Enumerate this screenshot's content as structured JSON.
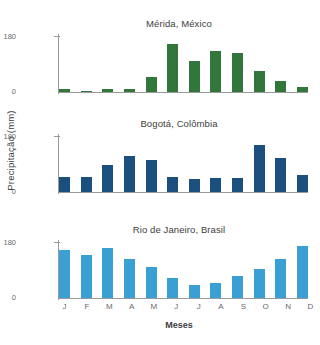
{
  "chart_data": [
    {
      "type": "bar",
      "title": "Mérida, México",
      "xlabel": "Meses",
      "ylabel": "Precipitação (mm)",
      "categories": [
        "J",
        "F",
        "M",
        "A",
        "M",
        "J",
        "J",
        "A",
        "S",
        "O",
        "N",
        "D"
      ],
      "values": [
        10,
        5,
        11,
        9,
        55,
        170,
        110,
        145,
        140,
        75,
        40,
        18
      ],
      "ylim": [
        0,
        200
      ],
      "yticks": [
        0,
        180
      ],
      "ytick_labels": [
        "0",
        "180"
      ],
      "color": "#31763a",
      "grid": false,
      "legend": "none"
    },
    {
      "type": "bar",
      "title": "Bogotá, Colômbia",
      "xlabel": "Meses",
      "ylabel": "Precipitação (mm)",
      "categories": [
        "J",
        "F",
        "M",
        "A",
        "M",
        "J",
        "J",
        "A",
        "S",
        "O",
        "N",
        "D"
      ],
      "values": [
        52,
        53,
        95,
        128,
        115,
        55,
        45,
        50,
        50,
        168,
        120,
        62
      ],
      "ylim": [
        0,
        200
      ],
      "yticks": [
        0,
        180
      ],
      "ytick_labels": [
        "0",
        "180"
      ],
      "color": "#1b4f7e",
      "grid": false,
      "legend": "none"
    },
    {
      "type": "bar",
      "title": "Rio de Janeiro, Brasil",
      "xlabel": "Meses",
      "ylabel": "Precipitação (mm)",
      "categories": [
        "J",
        "F",
        "M",
        "A",
        "M",
        "J",
        "J",
        "A",
        "S",
        "O",
        "N",
        "D"
      ],
      "values": [
        172,
        155,
        178,
        140,
        110,
        72,
        45,
        52,
        80,
        105,
        140,
        185
      ],
      "ylim": [
        0,
        200
      ],
      "yticks": [
        0,
        180
      ],
      "ytick_labels": [
        "0",
        "180"
      ],
      "color": "#3aa0d4",
      "grid": false,
      "legend": "none"
    }
  ],
  "axis": {
    "ylabel": "Precipitação (mm)",
    "xlabel": "Meses",
    "ytick_top": "180",
    "ytick_zero": "0",
    "months": [
      "J",
      "F",
      "M",
      "A",
      "M",
      "J",
      "J",
      "A",
      "S",
      "O",
      "N",
      "D"
    ]
  }
}
